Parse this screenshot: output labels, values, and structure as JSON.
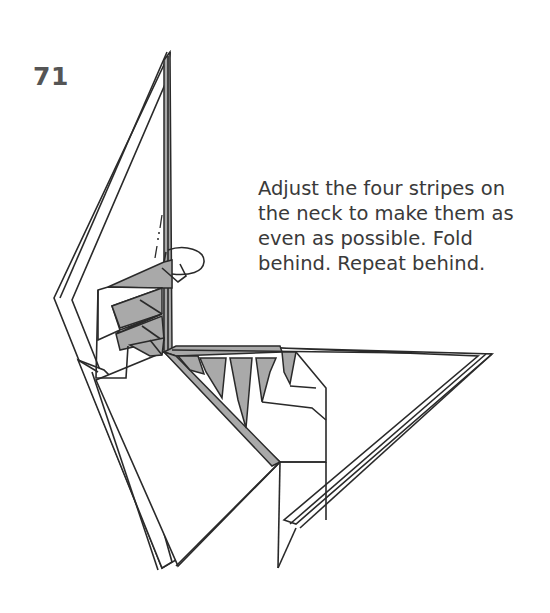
{
  "step": {
    "number": "71"
  },
  "instructions": {
    "lines": [
      "Adjust the four stripes on",
      "the neck to make them as",
      "even as possible. Fold",
      "behind. Repeat behind."
    ]
  },
  "diagram": {
    "colors": {
      "paper": "#ffffff",
      "shaded": "#a9a9a9",
      "line": "#2a2a2a",
      "text": "#3a3a3a"
    },
    "annotations": [
      "fold-behind-arrow",
      "valley-fold-dotted-line"
    ]
  }
}
